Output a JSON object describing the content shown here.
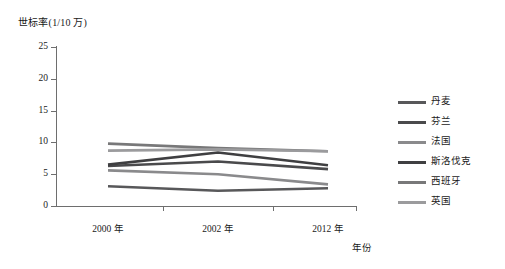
{
  "chart_data": {
    "type": "line",
    "title": "",
    "ylabel": "世标率(1/10 万)",
    "xlabel": "年份",
    "categories": [
      "2000 年",
      "2002 年",
      "2012 年"
    ],
    "x_values": [
      2000,
      2002,
      2012
    ],
    "ylim": [
      0,
      25
    ],
    "yticks": [
      0,
      5,
      10,
      15,
      20,
      25
    ],
    "ytick_labels": [
      "0",
      "5",
      "10",
      "15",
      "20",
      "25"
    ],
    "grid": false,
    "legend_position": "right",
    "series": [
      {
        "name": "丹麦",
        "values": [
          3.1,
          2.4,
          2.8
        ],
        "color": "#58585a"
      },
      {
        "name": "芬兰",
        "values": [
          6.3,
          7.0,
          5.8
        ],
        "color": "#4a4a4c"
      },
      {
        "name": "法国",
        "values": [
          5.6,
          5.0,
          3.4
        ],
        "color": "#8a8a8c"
      },
      {
        "name": "斯洛伐克",
        "values": [
          6.5,
          8.4,
          6.4
        ],
        "color": "#3f3f41"
      },
      {
        "name": "西班牙",
        "values": [
          9.8,
          9.1,
          8.6
        ],
        "color": "#787879"
      },
      {
        "name": "英国",
        "values": [
          8.7,
          8.9,
          8.6
        ],
        "color": "#9b9b9d"
      }
    ]
  },
  "axis": {
    "y_title": "世标率(1/10 万)",
    "x_title": "年份"
  }
}
